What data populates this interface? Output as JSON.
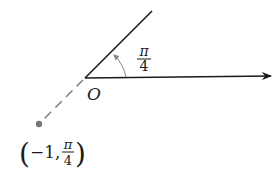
{
  "diagram": {
    "type": "polar-coordinates-point",
    "origin_label": "O",
    "angle_label": {
      "numerator": "π",
      "denominator": "4"
    },
    "point_label": {
      "open": "(",
      "r": "−1,",
      "theta_numerator": "π",
      "theta_denominator": "4",
      "close": ")"
    },
    "point": {
      "r": -1,
      "theta": "π/4"
    },
    "colors": {
      "line": "#1a1a1a",
      "dashed_line": "#777777",
      "point": "#777777",
      "arc": "#888888"
    }
  }
}
